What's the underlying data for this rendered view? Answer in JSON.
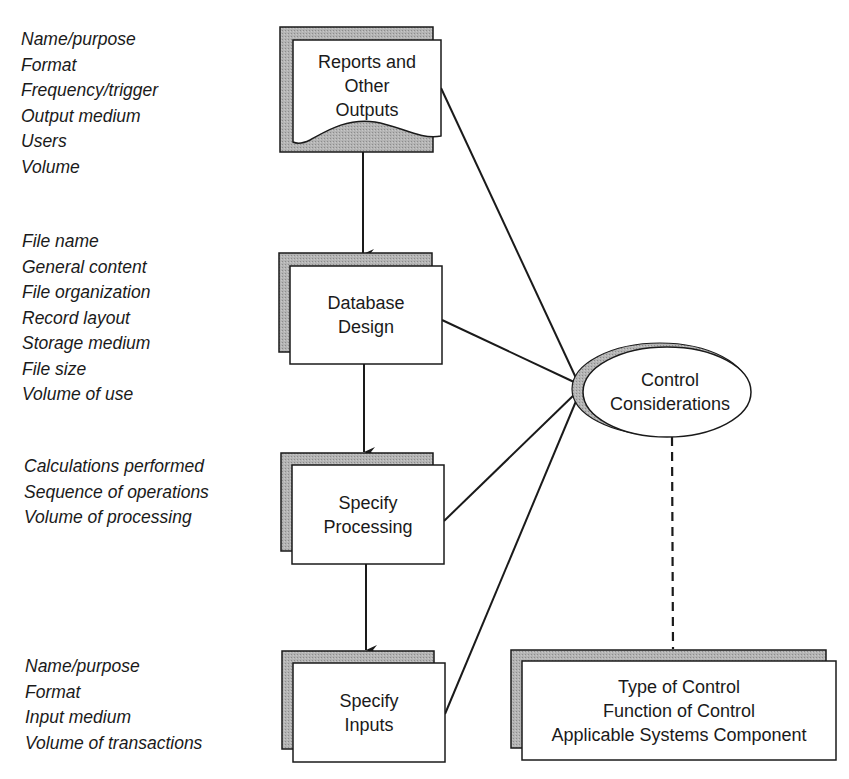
{
  "diagram": {
    "type": "flow",
    "colors": {
      "line": "#1a1a1a",
      "shadow_fill": "#a9a9a9",
      "box_fill": "#ffffff",
      "text": "#1a1a1a"
    },
    "steps": [
      {
        "id": "reports",
        "shape": "document",
        "label_lines": [
          "Reports and",
          "Other",
          "Outputs"
        ],
        "attributes": [
          "Name/purpose",
          "Format",
          "Frequency/trigger",
          "Output medium",
          "Users",
          "Volume"
        ]
      },
      {
        "id": "database",
        "shape": "rectangle",
        "label_lines": [
          "Database",
          "Design"
        ],
        "attributes": [
          "File name",
          "General content",
          "File organization",
          "Record layout",
          "Storage medium",
          "File size",
          "Volume of use"
        ]
      },
      {
        "id": "processing",
        "shape": "rectangle",
        "label_lines": [
          "Specify",
          "Processing"
        ],
        "attributes": [
          "Calculations performed",
          "Sequence of operations",
          "Volume of processing"
        ]
      },
      {
        "id": "inputs",
        "shape": "rectangle",
        "label_lines": [
          "Specify",
          "Inputs"
        ],
        "attributes": [
          "Name/purpose",
          "Format",
          "Input medium",
          "Volume of transactions"
        ]
      }
    ],
    "hub": {
      "id": "control",
      "shape": "ellipse",
      "label_lines": [
        "Control",
        "Considerations"
      ]
    },
    "detail": {
      "id": "control-detail",
      "shape": "rectangle",
      "label_lines": [
        "Type of Control",
        "Function of Control",
        "Applicable Systems Component"
      ]
    },
    "edges": [
      {
        "from": "reports",
        "to": "database",
        "style": "arrow"
      },
      {
        "from": "database",
        "to": "processing",
        "style": "arrow"
      },
      {
        "from": "processing",
        "to": "inputs",
        "style": "arrow"
      },
      {
        "from": "reports",
        "to": "control",
        "style": "line"
      },
      {
        "from": "database",
        "to": "control",
        "style": "line"
      },
      {
        "from": "processing",
        "to": "control",
        "style": "line"
      },
      {
        "from": "inputs",
        "to": "control",
        "style": "line"
      },
      {
        "from": "control",
        "to": "control-detail",
        "style": "dashed"
      }
    ]
  }
}
